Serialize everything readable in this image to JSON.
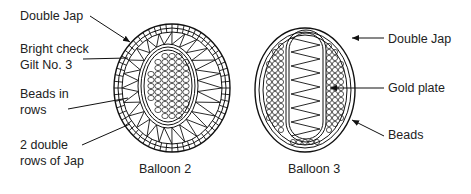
{
  "figure": {
    "balloon2": {
      "caption": "Balloon 2",
      "labels": [
        {
          "text": "Double Jap"
        },
        {
          "text": "Bright check\nGilt No. 3"
        },
        {
          "text": "Beads in\nrows"
        },
        {
          "text": "2 double\nrows of Jap"
        }
      ]
    },
    "balloon3": {
      "caption": "Balloon 3",
      "labels": [
        {
          "text": "Double Jap"
        },
        {
          "text": "Gold plate"
        },
        {
          "text": "Beads"
        }
      ]
    }
  }
}
